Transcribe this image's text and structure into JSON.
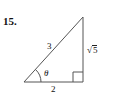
{
  "problem": {
    "number": "15."
  },
  "triangle": {
    "hypotenuse_label": "3",
    "opposite_label_symbol": "√",
    "opposite_label_radicand": "5",
    "adjacent_label": "2",
    "angle_label": "θ",
    "right_angle_marker": true
  },
  "colors": {
    "stroke": "#555555",
    "text": "#111111"
  }
}
